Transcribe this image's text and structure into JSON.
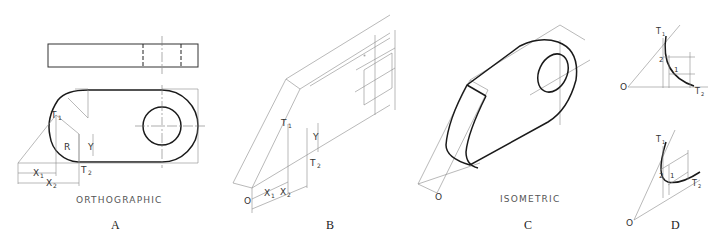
{
  "figure": {
    "top_caption_cropped": "",
    "panels": [
      {
        "id": "A",
        "letter": "A",
        "view_label": "ORTHOGRAPHIC",
        "labels": {
          "t1": "T",
          "t1_sub": "1",
          "t2": "T",
          "t2_sub": "2",
          "r": "R",
          "y": "Y",
          "x1": "X",
          "x1_sub": "1",
          "x2": "X",
          "x2_sub": "2"
        }
      },
      {
        "id": "B",
        "letter": "B",
        "view_label": "",
        "labels": {
          "o": "O",
          "t1": "T",
          "t1_sub": "1",
          "t2": "T",
          "t2_sub": "2",
          "y": "Y",
          "x1": "X",
          "x1_sub": "1",
          "x2": "X",
          "x2_sub": "2"
        }
      },
      {
        "id": "C",
        "letter": "C",
        "view_label": "ISOMETRIC",
        "labels": {
          "o": "O"
        }
      },
      {
        "id": "D",
        "letter": "D",
        "view_label": "",
        "labels": {
          "o": "O",
          "t1": "T",
          "t1_sub": "1",
          "t2": "T",
          "t2_sub": "2",
          "p1": "1",
          "p2": "2"
        }
      }
    ]
  }
}
